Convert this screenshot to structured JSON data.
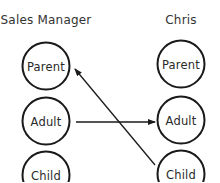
{
  "diagram": {
    "type": "transactional-analysis-crossed-transaction",
    "columns": [
      {
        "id": "sales-manager",
        "title": "Sales Manager",
        "center_x": 46,
        "ego_states": [
          {
            "id": "parent",
            "label": "Parent",
            "cy": 66
          },
          {
            "id": "adult",
            "label": "Adult",
            "cy": 121
          },
          {
            "id": "child",
            "label": "Child",
            "cy": 175
          }
        ]
      },
      {
        "id": "chris",
        "title": "Chris",
        "center_x": 181,
        "ego_states": [
          {
            "id": "parent",
            "label": "Parent",
            "cy": 64
          },
          {
            "id": "adult",
            "label": "Adult",
            "cy": 120
          },
          {
            "id": "child",
            "label": "Child",
            "cy": 174
          }
        ]
      }
    ],
    "transactions": [
      {
        "from": "Sales Manager.Adult",
        "to": "Chris.Adult",
        "direction": "left-to-right",
        "line": {
          "x1": 76,
          "y1": 122,
          "x2": 155,
          "y2": 122
        }
      },
      {
        "from": "Chris.Child",
        "to": "Sales Manager.Parent",
        "direction": "right-to-left",
        "line": {
          "x1": 155,
          "y1": 165,
          "x2": 74,
          "y2": 68
        }
      }
    ],
    "colors": {
      "stroke": "#1a1a1a",
      "text": "#2a2a2a",
      "background": "#ffffff"
    }
  }
}
